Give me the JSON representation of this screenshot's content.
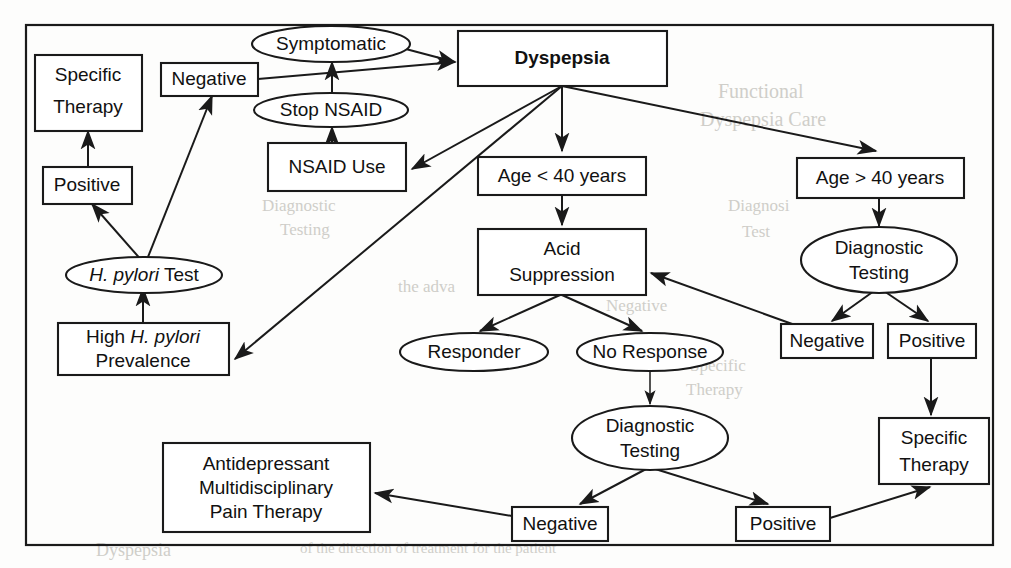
{
  "figure": {
    "type": "flowchart",
    "background_color": "#fdfdfc",
    "line_color": "#1a1a1a"
  },
  "nodes": {
    "dyspepsia": {
      "label": "Dyspepsia",
      "shape": "rect",
      "bold": true
    },
    "symptomatic": {
      "label": "Symptomatic",
      "shape": "ellipse"
    },
    "stop_nsaid": {
      "label": "Stop NSAID",
      "shape": "ellipse"
    },
    "nsaid_use": {
      "label": "NSAID Use",
      "shape": "rect"
    },
    "negative_top": {
      "label": "Negative",
      "shape": "rect"
    },
    "specific_therapy_left": {
      "line1": "Specific",
      "line2": "Therapy",
      "shape": "rect"
    },
    "positive_left": {
      "label": "Positive",
      "shape": "rect"
    },
    "hpylori_test": {
      "italic": "H. pylori",
      "plain": " Test",
      "shape": "ellipse"
    },
    "high_prevalence": {
      "plain1": "High ",
      "italic1": "H. pylori",
      "line2": "Prevalence",
      "shape": "rect"
    },
    "age_under_40": {
      "label": "Age < 40 years",
      "shape": "rect"
    },
    "age_over_40": {
      "label": "Age > 40 years",
      "shape": "rect"
    },
    "acid_suppression": {
      "line1": "Acid",
      "line2": "Suppression",
      "shape": "rect"
    },
    "diagnostic_testing_right": {
      "line1": "Diagnostic",
      "line2": "Testing",
      "shape": "ellipse"
    },
    "negative_right": {
      "label": "Negative",
      "shape": "rect"
    },
    "positive_right": {
      "label": "Positive",
      "shape": "rect"
    },
    "specific_therapy_right": {
      "line1": "Specific",
      "line2": "Therapy",
      "shape": "rect"
    },
    "responder": {
      "label": "Responder",
      "shape": "ellipse"
    },
    "no_response": {
      "label": "No Response",
      "shape": "ellipse"
    },
    "diagnostic_testing_center": {
      "line1": "Diagnostic",
      "line2": "Testing",
      "shape": "ellipse"
    },
    "negative_bottom": {
      "label": "Negative",
      "shape": "rect"
    },
    "positive_bottom": {
      "label": "Positive",
      "shape": "rect"
    },
    "antidepressant": {
      "line1": "Antidepressant",
      "line2": "Multidisciplinary",
      "line3": "Pain Therapy",
      "shape": "rect"
    }
  },
  "edges": [
    {
      "from": "symptomatic",
      "to": "dyspepsia"
    },
    {
      "from": "negative_top",
      "to": "dyspepsia"
    },
    {
      "from": "stop_nsaid",
      "to": "symptomatic"
    },
    {
      "from": "nsaid_use",
      "to": "stop_nsaid"
    },
    {
      "from": "dyspepsia",
      "to": "nsaid_use"
    },
    {
      "from": "dyspepsia",
      "to": "high_prevalence"
    },
    {
      "from": "dyspepsia",
      "to": "age_under_40"
    },
    {
      "from": "dyspepsia",
      "to": "age_over_40"
    },
    {
      "from": "high_prevalence",
      "to": "hpylori_test"
    },
    {
      "from": "hpylori_test",
      "to": "positive_left"
    },
    {
      "from": "hpylori_test",
      "to": "negative_top"
    },
    {
      "from": "positive_left",
      "to": "specific_therapy_left"
    },
    {
      "from": "age_under_40",
      "to": "acid_suppression"
    },
    {
      "from": "acid_suppression",
      "to": "responder"
    },
    {
      "from": "acid_suppression",
      "to": "no_response"
    },
    {
      "from": "no_response",
      "to": "diagnostic_testing_center"
    },
    {
      "from": "diagnostic_testing_center",
      "to": "negative_bottom"
    },
    {
      "from": "diagnostic_testing_center",
      "to": "positive_bottom"
    },
    {
      "from": "negative_bottom",
      "to": "antidepressant"
    },
    {
      "from": "positive_bottom",
      "to": "specific_therapy_right"
    },
    {
      "from": "age_over_40",
      "to": "diagnostic_testing_right"
    },
    {
      "from": "diagnostic_testing_right",
      "to": "negative_right"
    },
    {
      "from": "diagnostic_testing_right",
      "to": "positive_right"
    },
    {
      "from": "positive_right",
      "to": "specific_therapy_right"
    },
    {
      "from": "negative_right",
      "to": "acid_suppression"
    }
  ],
  "ghost_text": {
    "g1": "Functional",
    "g2": "Dyspepsia Care",
    "g3": "Diagnosi",
    "g4": "Test",
    "g5": "the adva",
    "g6": "Negative",
    "g7": "Diagnostic",
    "g8": "Testing",
    "g9": "Therapy",
    "g10": "Specific",
    "g11": "Dyspepsia",
    "g12": "of the direction of treatment for the patient"
  }
}
